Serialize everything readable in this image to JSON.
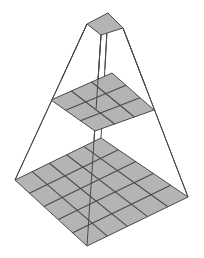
{
  "diagram": {
    "title": "",
    "colors": {
      "background": "#ffffff",
      "cell_fill": "#b4b4b4",
      "line": "#4a4a4a"
    },
    "layers": [
      {
        "name": "output",
        "grid": 1,
        "corners": {
          "left": [
            87,
            24
          ],
          "top": [
            108,
            13
          ],
          "right": [
            123,
            28
          ],
          "bottom": [
            101,
            35
          ]
        }
      },
      {
        "name": "middle",
        "grid": 3,
        "corners": {
          "left": [
            51,
            100
          ],
          "top": [
            112,
            73
          ],
          "right": [
            154,
            110
          ],
          "bottom": [
            95,
            131
          ]
        }
      },
      {
        "name": "input",
        "grid": 5,
        "corners": {
          "left": [
            15,
            180
          ],
          "top": [
            101,
            138
          ],
          "right": [
            188,
            197
          ],
          "bottom": [
            87,
            246
          ]
        }
      }
    ]
  }
}
